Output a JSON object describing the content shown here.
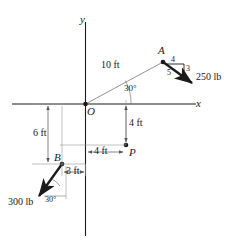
{
  "figure": {
    "axes": {
      "x_label": "x",
      "y_label": "y",
      "origin_label": "O"
    },
    "points": [
      {
        "id": "A",
        "label": "A"
      },
      {
        "id": "B",
        "label": "B"
      },
      {
        "id": "P",
        "label": "P"
      },
      {
        "id": "O",
        "label": "O"
      }
    ],
    "forces": [
      {
        "id": "force-a",
        "magnitude_label": "250 lb",
        "slope_triangle": {
          "horizontal": "4",
          "vertical": "3",
          "hypotenuse": "5"
        }
      },
      {
        "id": "force-b",
        "magnitude_label": "300 lb",
        "angle_label": "30°"
      }
    ],
    "dimensions": [
      {
        "id": "oa-length",
        "label": "10 ft"
      },
      {
        "id": "oa-angle",
        "label": "30°"
      },
      {
        "id": "p-vertical",
        "label": "4 ft"
      },
      {
        "id": "p-horizontal",
        "label": "4 ft"
      },
      {
        "id": "b-vertical",
        "label": "6 ft"
      },
      {
        "id": "b-horizontal",
        "label": "3 ft"
      }
    ],
    "colors": {
      "stroke": "#1a1a1a",
      "thin": "#555555",
      "background": "#ffffff"
    }
  }
}
